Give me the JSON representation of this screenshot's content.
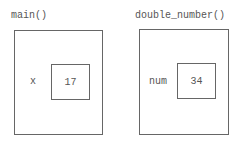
{
  "frames": [
    {
      "title": "main()",
      "variable": {
        "name": "x",
        "value": "17"
      }
    },
    {
      "title": "double_number()",
      "variable": {
        "name": "num",
        "value": "34"
      }
    }
  ]
}
